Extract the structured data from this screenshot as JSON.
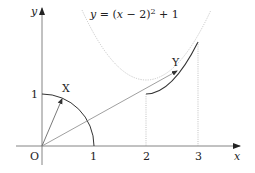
{
  "figure": {
    "equation": "y = (x − 2)² + 1",
    "equation_parts": {
      "lhs": "y",
      "eq": " = (",
      "x": "x",
      "rest": " − 2)",
      "sup": "2",
      "tail": " + 1"
    },
    "axes": {
      "x_label": "x",
      "y_label": "y",
      "origin_label": "O",
      "x_ticks": [
        "1",
        "2",
        "3"
      ],
      "y_ticks": [
        "1"
      ]
    },
    "points": {
      "X": "X",
      "Y": "Y"
    },
    "colors": {
      "axis": "#555555",
      "curve": "#333333",
      "dotted": "#aaaaaa",
      "vector": "#777777"
    }
  }
}
